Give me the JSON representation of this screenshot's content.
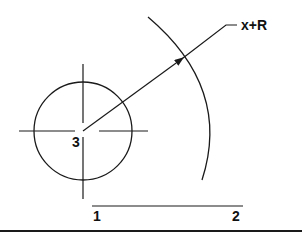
{
  "diagram": {
    "labels": {
      "leader_label": "x+R",
      "center_label": "3",
      "point_1": "1",
      "point_2": "2"
    },
    "colors": {
      "stroke": "#1a1a1a",
      "background": "#ffffff"
    }
  }
}
